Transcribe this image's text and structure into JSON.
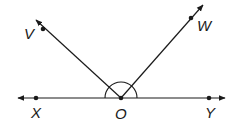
{
  "diagram": {
    "type": "geometry-angles",
    "colors": {
      "stroke": "#1a1a1a",
      "background": "#ffffff"
    },
    "points": {
      "O": {
        "label": "O",
        "x": 121,
        "y": 98
      },
      "X": {
        "label": "X",
        "x": 36,
        "y": 98
      },
      "Y": {
        "label": "Y",
        "x": 209,
        "y": 98
      },
      "V": {
        "label": "V",
        "x": 43,
        "y": 29
      },
      "W": {
        "label": "W",
        "x": 191,
        "y": 18
      }
    },
    "line": {
      "name": "XY",
      "from": [
        17,
        98
      ],
      "to": [
        226,
        98
      ],
      "arrows": "both"
    },
    "rays": [
      {
        "name": "OV",
        "from": "O",
        "through": "V",
        "arrow": true
      },
      {
        "name": "OW",
        "from": "O",
        "through": "W",
        "arrow": true
      }
    ],
    "angle_mark": {
      "vertex": "O",
      "type": "semicircle-arc",
      "radius": 16
    }
  }
}
